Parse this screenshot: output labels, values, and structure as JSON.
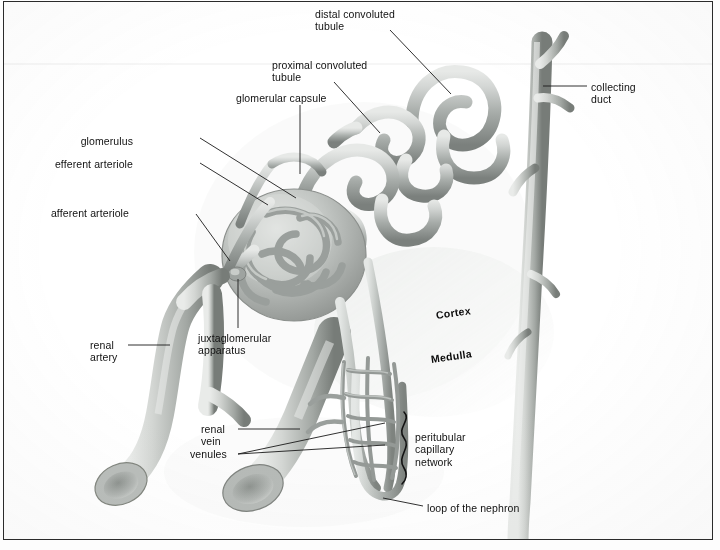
{
  "figure": {
    "background_color": "#ffffff",
    "border_color": "#2b2b2b",
    "width": 720,
    "height": 550
  },
  "labels": [
    {
      "id": "distal-convoluted-tubule",
      "text": "distal convoluted\ntubule",
      "align": "left",
      "x": 311,
      "y": 6
    },
    {
      "id": "proximal-convoluted-tubule",
      "text": "proximal convoluted\ntubule",
      "align": "left",
      "x": 268,
      "y": 57
    },
    {
      "id": "glomerular-capsule",
      "text": "glomerular capsule",
      "align": "left",
      "x": 232,
      "y": 90
    },
    {
      "id": "collecting-duct",
      "text": "collecting\nduct",
      "align": "left",
      "x": 587,
      "y": 79
    },
    {
      "id": "glomerulus",
      "text": "glomerulus",
      "align": "right",
      "x": 131,
      "y": 133
    },
    {
      "id": "efferent-arteriole",
      "text": "efferent arteriole",
      "align": "right",
      "x": 96,
      "y": 156
    },
    {
      "id": "afferent-arteriole",
      "text": "afferent arteriole",
      "align": "right",
      "x": 88,
      "y": 205
    },
    {
      "id": "renal-artery",
      "text": "renal\nartery",
      "align": "left",
      "x": 86,
      "y": 337
    },
    {
      "id": "juxtaglomerular-apparatus",
      "text": "juxtaglomerular\napparatus",
      "align": "left",
      "x": 194,
      "y": 330
    },
    {
      "id": "renal-vein",
      "text": "renal\nvein",
      "align": "left",
      "x": 197,
      "y": 421
    },
    {
      "id": "venules",
      "text": "venules",
      "align": "left",
      "x": 186,
      "y": 446
    },
    {
      "id": "peritubular-capillary-network",
      "text": "peritubular\ncapillary\nnetwork",
      "align": "left",
      "x": 411,
      "y": 429
    },
    {
      "id": "loop-of-the-nephron",
      "text": "loop of the nephron",
      "align": "left",
      "x": 423,
      "y": 500
    }
  ],
  "regions": [
    {
      "id": "cortex",
      "text": "Cortex",
      "x": 432,
      "y": 313
    },
    {
      "id": "medulla",
      "text": "Medulla",
      "x": 427,
      "y": 357
    }
  ],
  "leaders": [
    {
      "id": "leader-distal-convoluted-tubule",
      "from": [
        386,
        28
      ],
      "to": [
        447,
        92
      ]
    },
    {
      "id": "leader-proximal-convoluted-tubule",
      "from": [
        330,
        80
      ],
      "to": [
        376,
        131
      ]
    },
    {
      "id": "leader-glomerular-capsule",
      "from": [
        296,
        103
      ],
      "to": [
        296,
        172
      ]
    },
    {
      "id": "leader-collecting-duct",
      "from": [
        583,
        84
      ],
      "to": [
        539,
        84
      ]
    },
    {
      "id": "leader-glomerulus",
      "from": [
        196,
        136
      ],
      "to": [
        292,
        196
      ]
    },
    {
      "id": "leader-efferent-arteriole",
      "from": [
        196,
        161
      ],
      "to": [
        264,
        203
      ]
    },
    {
      "id": "leader-afferent-arteriole",
      "from": [
        192,
        212
      ],
      "to": [
        226,
        259
      ]
    },
    {
      "id": "leader-renal-artery",
      "from": [
        124,
        343
      ],
      "to": [
        166,
        343
      ]
    },
    {
      "id": "leader-juxtaglomerular-apparatus",
      "from": [
        234,
        326
      ],
      "to": [
        234,
        277
      ]
    },
    {
      "id": "leader-renal-vein",
      "from": [
        234,
        427
      ],
      "to": [
        296,
        427
      ]
    },
    {
      "id": "leader-venules-a",
      "from": [
        234,
        452
      ],
      "to": [
        381,
        421
      ]
    },
    {
      "id": "leader-venules-b",
      "from": [
        234,
        452
      ],
      "to": [
        381,
        443
      ]
    },
    {
      "id": "leader-loop-of-the-nephron",
      "from": [
        419,
        504
      ],
      "to": [
        379,
        496
      ]
    }
  ],
  "colors": {
    "ink": "#111111",
    "leader_line": "#1a1a1a",
    "tubule_light": "#d6d8d6",
    "tubule_mid": "#a9adaa",
    "tubule_dark": "#6f7472",
    "vessel_light": "#cfd2cf",
    "vessel_dark": "#7d817e",
    "shadow": "#c8ccc9"
  }
}
